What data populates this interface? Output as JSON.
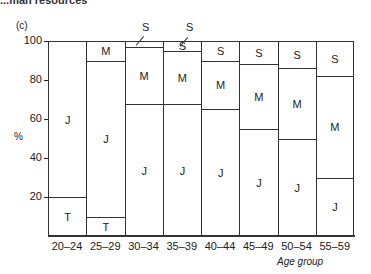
{
  "header_crop_text": "...man resources",
  "chart_data": {
    "type": "bar",
    "stacked": true,
    "panel_label": "(c)",
    "title": "",
    "xlabel": "Age group",
    "ylabel": "%",
    "ylim": [
      0,
      100
    ],
    "yticks": [
      20,
      40,
      60,
      80,
      100
    ],
    "grid": false,
    "legend": "inline segment labels",
    "categories": [
      "20–24",
      "25–29",
      "30–34",
      "35–39",
      "40–44",
      "45–49",
      "50–54",
      "55–59"
    ],
    "series": [
      {
        "name": "T",
        "values": [
          20,
          10,
          0,
          0,
          0,
          0,
          0,
          0
        ]
      },
      {
        "name": "J",
        "values": [
          80,
          80,
          67.5,
          67.5,
          65,
          55,
          50,
          30
        ]
      },
      {
        "name": "M",
        "values": [
          0,
          10,
          29.5,
          27.5,
          25,
          33,
          36,
          52
        ]
      },
      {
        "name": "S",
        "values": [
          0,
          0,
          3,
          5,
          10,
          12,
          14,
          18
        ]
      }
    ],
    "annotations": [
      {
        "text": "S",
        "category": "30–34",
        "note": "callout with leader line"
      },
      {
        "text": "S",
        "category": "35–39",
        "note": "callout with leader line"
      }
    ]
  },
  "labels": {
    "panel": "(c)",
    "y_unit": "%",
    "x_title": "Age group",
    "y_ticks": [
      "100",
      "80",
      "60",
      "40",
      "20"
    ],
    "x_ticks": [
      "20–24",
      "25–29",
      "30–34",
      "35–39",
      "40–44",
      "45–49",
      "50–54",
      "55–59"
    ],
    "callout_s": "S"
  }
}
